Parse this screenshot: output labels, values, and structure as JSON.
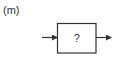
{
  "figure": {
    "panel_label": "(m)",
    "block": {
      "text": "?"
    },
    "input_arrow": {
      "direction": "right"
    },
    "output_arrow": {
      "direction": "right"
    },
    "colors": {
      "stroke": "#333333",
      "background": "#ffffff"
    }
  }
}
